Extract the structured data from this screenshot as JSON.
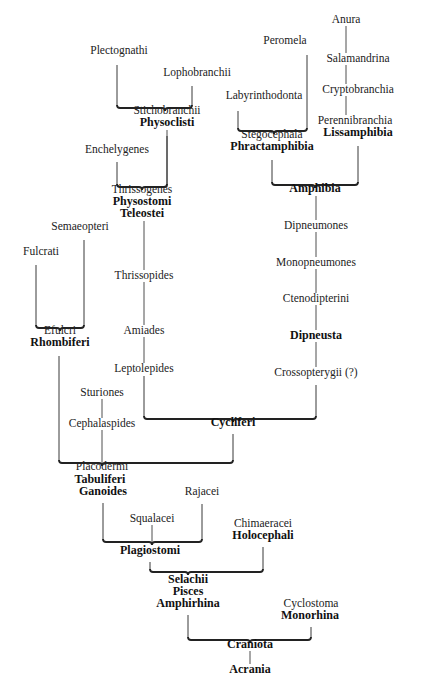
{
  "diagram": {
    "type": "phylogenetic-tree",
    "nodes": [
      {
        "id": "anura",
        "label": "Anura",
        "bold": false,
        "x": 346,
        "y": 20
      },
      {
        "id": "peromela",
        "label": "Peromela",
        "bold": false,
        "x": 285,
        "y": 41
      },
      {
        "id": "salamandrina",
        "label": "Salamandrina",
        "bold": false,
        "x": 358,
        "y": 59
      },
      {
        "id": "plectognathi",
        "label": "Plectognathi",
        "bold": false,
        "x": 119,
        "y": 51
      },
      {
        "id": "lophobranchii",
        "label": "Lophobranchii",
        "bold": false,
        "x": 197,
        "y": 73
      },
      {
        "id": "labyrinthodonta",
        "label": "Labyrinthodonta",
        "bold": false,
        "x": 264,
        "y": 96
      },
      {
        "id": "cryptobranchia",
        "label": "Cryptobranchia",
        "bold": false,
        "x": 358,
        "y": 90
      },
      {
        "id": "stichobranchii",
        "label": "Stichobranchii",
        "bold": false,
        "x": 167,
        "y": 111
      },
      {
        "id": "physoclisti",
        "label": "Physoclisti",
        "bold": true,
        "x": 167,
        "y": 123
      },
      {
        "id": "perennibranchia",
        "label": "Perennibranchia",
        "bold": false,
        "x": 355,
        "y": 121
      },
      {
        "id": "lissamphibia",
        "label": "Lissamphibia",
        "bold": true,
        "x": 358,
        "y": 133
      },
      {
        "id": "stegocephala",
        "label": "Stegocephala",
        "bold": false,
        "x": 272,
        "y": 135
      },
      {
        "id": "phractamphibia",
        "label": "Phractamphibia",
        "bold": true,
        "x": 272,
        "y": 147
      },
      {
        "id": "enchelygenes",
        "label": "Enchelygenes",
        "bold": false,
        "x": 117,
        "y": 150
      },
      {
        "id": "amphibia",
        "label": "Amphibia",
        "bold": true,
        "x": 315,
        "y": 189
      },
      {
        "id": "thrissogenes",
        "label": "Thrissogenes",
        "bold": false,
        "x": 142,
        "y": 190
      },
      {
        "id": "physostomi",
        "label": "Physostomi",
        "bold": true,
        "x": 142,
        "y": 202
      },
      {
        "id": "teleostei",
        "label": "Teleostei",
        "bold": true,
        "x": 142,
        "y": 214
      },
      {
        "id": "semaeopteri",
        "label": "Semaeopteri",
        "bold": false,
        "x": 80,
        "y": 227
      },
      {
        "id": "dipneumones",
        "label": "Dipneumones",
        "bold": false,
        "x": 316,
        "y": 226
      },
      {
        "id": "fulcrati",
        "label": "Fulcrati",
        "bold": false,
        "x": 41,
        "y": 252
      },
      {
        "id": "monopneumones",
        "label": "Monopneumones",
        "bold": false,
        "x": 316,
        "y": 263
      },
      {
        "id": "thrissopides",
        "label": "Thrissopides",
        "bold": false,
        "x": 144,
        "y": 276
      },
      {
        "id": "ctenodipterini",
        "label": "Ctenodipterini",
        "bold": false,
        "x": 316,
        "y": 299
      },
      {
        "id": "amiades",
        "label": "Amiades",
        "bold": false,
        "x": 144,
        "y": 331
      },
      {
        "id": "efulcri",
        "label": "Efulcri",
        "bold": false,
        "x": 60,
        "y": 331
      },
      {
        "id": "rhombiferi",
        "label": "Rhombiferi",
        "bold": true,
        "x": 60,
        "y": 343
      },
      {
        "id": "dipneusta",
        "label": "Dipneusta",
        "bold": true,
        "x": 316,
        "y": 336
      },
      {
        "id": "leptolepides",
        "label": "Leptolepides",
        "bold": false,
        "x": 144,
        "y": 369
      },
      {
        "id": "crossopterygii",
        "label": "Crossopterygii (?)",
        "bold": false,
        "x": 316,
        "y": 373
      },
      {
        "id": "sturiones",
        "label": "Sturiones",
        "bold": false,
        "x": 102,
        "y": 393
      },
      {
        "id": "cycliferi",
        "label": "Cycliferi",
        "bold": true,
        "x": 233,
        "y": 423
      },
      {
        "id": "cephalaspides",
        "label": "Cephalaspides",
        "bold": false,
        "x": 102,
        "y": 424
      },
      {
        "id": "placodermi",
        "label": "Placodermi",
        "bold": false,
        "x": 102,
        "y": 467
      },
      {
        "id": "tabuliferi",
        "label": "Tabuliferi",
        "bold": true,
        "x": 100,
        "y": 480
      },
      {
        "id": "ganoides",
        "label": "Ganoides",
        "bold": true,
        "x": 103,
        "y": 492
      },
      {
        "id": "rajacei",
        "label": "Rajacei",
        "bold": false,
        "x": 202,
        "y": 492
      },
      {
        "id": "squalacei",
        "label": "Squalacei",
        "bold": false,
        "x": 152,
        "y": 519
      },
      {
        "id": "chimaeracei",
        "label": "Chimaeracei",
        "bold": false,
        "x": 263,
        "y": 524
      },
      {
        "id": "holocephali",
        "label": "Holocephali",
        "bold": true,
        "x": 263,
        "y": 536
      },
      {
        "id": "plagiostomi",
        "label": "Plagiostomi",
        "bold": true,
        "x": 150,
        "y": 551
      },
      {
        "id": "selachii",
        "label": "Selachii",
        "bold": true,
        "x": 188,
        "y": 580
      },
      {
        "id": "pisces",
        "label": "Pisces",
        "bold": true,
        "x": 188,
        "y": 592
      },
      {
        "id": "amphirhina",
        "label": "Amphirhina",
        "bold": true,
        "x": 188,
        "y": 604
      },
      {
        "id": "cyclostoma",
        "label": "Cyclostoma",
        "bold": false,
        "x": 311,
        "y": 604
      },
      {
        "id": "monorhina",
        "label": "Monorhina",
        "bold": true,
        "x": 310,
        "y": 616
      },
      {
        "id": "craniota",
        "label": "Craniota",
        "bold": true,
        "x": 250,
        "y": 645
      },
      {
        "id": "acrania",
        "label": "Acrania",
        "bold": true,
        "x": 250,
        "y": 670
      }
    ],
    "brackets": [
      {
        "id": "physoclisti-bracket",
        "x1": 117,
        "x2": 192,
        "y": 108,
        "tip": 165,
        "stems": [
          [
            117,
            65
          ],
          [
            192,
            86
          ]
        ]
      },
      {
        "id": "phractamphibia-bracket",
        "x1": 238,
        "x2": 307,
        "y": 131,
        "tip": 274,
        "stems": [
          [
            238,
            111
          ],
          [
            307,
            55
          ]
        ]
      },
      {
        "id": "teleostei-bracket",
        "x1": 117,
        "x2": 167,
        "y": 187,
        "tip": 142,
        "stems": [
          [
            117,
            162
          ],
          [
            167,
            136
          ]
        ]
      },
      {
        "id": "amphibia-bracket",
        "x1": 272,
        "x2": 358,
        "y": 185,
        "tip": 315,
        "stems": [
          [
            272,
            160
          ],
          [
            358,
            146
          ]
        ]
      },
      {
        "id": "rhombiferi-bracket",
        "x1": 36,
        "x2": 84,
        "y": 328,
        "tip": 60,
        "stems": [
          [
            36,
            265
          ],
          [
            84,
            240
          ]
        ]
      },
      {
        "id": "cycliferi-bracket",
        "x1": 144,
        "x2": 316,
        "y": 419,
        "tip": 233,
        "stems": [
          [
            144,
            376
          ],
          [
            316,
            385
          ]
        ]
      },
      {
        "id": "tabuliferi-bracket",
        "x1": 59,
        "x2": 233,
        "y": 463,
        "tip": 102,
        "stems": [
          [
            59,
            356
          ],
          [
            233,
            434
          ]
        ]
      },
      {
        "id": "plagiostomi-bracket",
        "x1": 103,
        "x2": 202,
        "y": 542,
        "tip": 152,
        "stems": [
          [
            103,
            503
          ],
          [
            202,
            504
          ]
        ]
      },
      {
        "id": "amphirhina-bracket",
        "x1": 150,
        "x2": 263,
        "y": 572,
        "tip": 188,
        "stems": [
          [
            150,
            562
          ],
          [
            263,
            547
          ]
        ]
      },
      {
        "id": "craniota-bracket",
        "x1": 188,
        "x2": 311,
        "y": 640,
        "tip": 250,
        "stems": [
          [
            188,
            615
          ],
          [
            311,
            627
          ]
        ]
      }
    ],
    "connectors": [
      {
        "from": "anura",
        "to": "salamandrina",
        "x": 346,
        "y1": 26,
        "y2": 53
      },
      {
        "from": "salamandrina",
        "to": "cryptobranchia",
        "x": 346,
        "y1": 65,
        "y2": 84
      },
      {
        "from": "cryptobranchia",
        "to": "perennibranchia",
        "x": 346,
        "y1": 96,
        "y2": 115
      },
      {
        "from": "physoclisti",
        "to": "thrissogenes",
        "x": 167,
        "y1": 130,
        "y2": 187
      },
      {
        "from": "amphibia",
        "to": "dipneumones",
        "x": 316,
        "y1": 196,
        "y2": 220
      },
      {
        "from": "dipneumones",
        "to": "monopneumones",
        "x": 316,
        "y1": 232,
        "y2": 257
      },
      {
        "from": "monopneumones",
        "to": "ctenodipterini",
        "x": 316,
        "y1": 269,
        "y2": 293
      },
      {
        "from": "ctenodipterini",
        "to": "dipneusta",
        "x": 316,
        "y1": 305,
        "y2": 330
      },
      {
        "from": "dipneusta",
        "to": "crossopterygii",
        "x": 316,
        "y1": 342,
        "y2": 367
      },
      {
        "from": "teleostei",
        "to": "thrissopides",
        "x": 144,
        "y1": 221,
        "y2": 270
      },
      {
        "from": "thrissopides",
        "to": "amiades",
        "x": 144,
        "y1": 282,
        "y2": 325
      },
      {
        "from": "amiades",
        "to": "leptolepides",
        "x": 144,
        "y1": 337,
        "y2": 363
      },
      {
        "from": "sturiones",
        "to": "cephalaspides",
        "x": 102,
        "y1": 399,
        "y2": 418
      },
      {
        "from": "cephalaspides",
        "to": "placodermi",
        "x": 102,
        "y1": 430,
        "y2": 463
      },
      {
        "from": "squalacei",
        "to": "plagiostomi",
        "x": 152,
        "y1": 525,
        "y2": 542
      },
      {
        "from": "craniota",
        "to": "acrania",
        "x": 250,
        "y1": 651,
        "y2": 664
      }
    ]
  }
}
